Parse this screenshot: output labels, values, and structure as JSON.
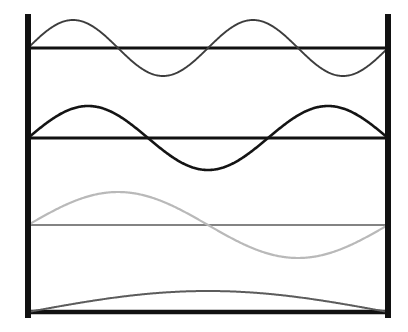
{
  "figure": {
    "width": 408,
    "height": 332,
    "background": "#ffffff"
  },
  "boundaries": {
    "left_wall": {
      "label": "left-boundary-wall",
      "x": 28,
      "y_top": 14,
      "y_bottom": 318,
      "thickness": 6,
      "color": "#111111"
    },
    "right_wall": {
      "label": "right-boundary-wall",
      "x": 388,
      "y_top": 14,
      "y_bottom": 318,
      "thickness": 6,
      "color": "#111111"
    }
  },
  "chart_data": {
    "type": "line",
    "xlabel": "",
    "ylabel": "",
    "xlim": [
      0,
      1
    ],
    "ylim": [
      -1,
      1
    ],
    "grid": false,
    "legend": "none",
    "x_start_px": 28,
    "x_end_px": 388,
    "series": [
      {
        "name": "mode-4",
        "periods": 2,
        "harmonic": 4,
        "baseline_y": 48,
        "amplitude_px": 28,
        "phase": 0,
        "color": "#3d3d3d",
        "stroke_width": 1.9,
        "baseline_color": "#111111",
        "baseline_width": 3.0
      },
      {
        "name": "mode-3",
        "periods": 1.5,
        "harmonic": 3,
        "baseline_y": 138,
        "amplitude_px": 32,
        "phase": 0,
        "color": "#141414",
        "stroke_width": 2.6,
        "baseline_color": "#111111",
        "baseline_width": 3.0
      },
      {
        "name": "mode-2",
        "periods": 1,
        "harmonic": 2,
        "baseline_y": 225,
        "amplitude_px": 33,
        "phase": 0,
        "color": "#b9b9b9",
        "stroke_width": 2.2,
        "baseline_color": "#5a5a5a",
        "baseline_width": 1.6
      },
      {
        "name": "mode-1",
        "periods": 0.5,
        "harmonic": 1,
        "baseline_y": 312,
        "amplitude_px": 21,
        "phase": 0,
        "color": "#5c5c5c",
        "stroke_width": 2.0,
        "baseline_color": "#111111",
        "baseline_width": 4.5
      }
    ]
  }
}
